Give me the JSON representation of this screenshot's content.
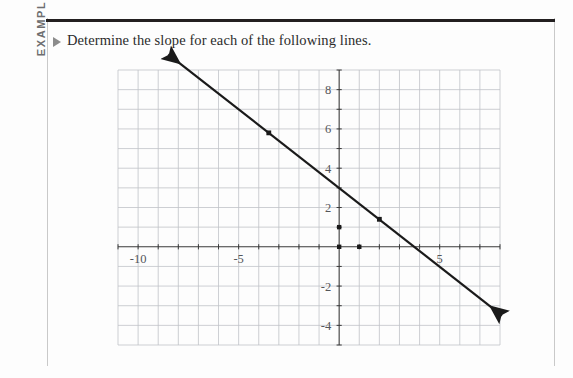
{
  "page": {
    "label_vertical": "EXAMPLE",
    "heading": "Determine the slope for each of the following lines.",
    "bullet": "triangle-bullet",
    "colors": {
      "rule": "#231f20",
      "frame": "#c9c9c9",
      "label": "#6d6e70",
      "text": "#2b2b2b",
      "grid_minor": "#c0c3c8",
      "grid_major": "#8a8d92",
      "axis": "#3a3a3a",
      "line": "#1a1a1a",
      "tick_text": "#54565a"
    }
  },
  "chart_data": {
    "type": "line",
    "title": "",
    "xlabel": "",
    "ylabel": "",
    "xlim": [
      -11,
      8
    ],
    "ylim": [
      -5,
      9
    ],
    "grid": true,
    "grid_step": 1,
    "legend": "none",
    "x_ticks": [
      -10,
      -5,
      5
    ],
    "x_tick_labels": [
      "-10",
      "-5",
      "5"
    ],
    "y_ticks": [
      8,
      6,
      4,
      2,
      -2,
      -4
    ],
    "y_tick_labels": [
      "8",
      "6",
      "4",
      "2",
      "-2",
      "-4"
    ],
    "series": [
      {
        "name": "line-1",
        "slope": -0.8,
        "y_intercept": 3,
        "x_intercept": 3.75,
        "endpoints": [
          [
            -8.5,
            9.8
          ],
          [
            8.1,
            -3.5
          ]
        ],
        "arrowheads": [
          "start",
          "end"
        ],
        "points": [
          [
            -3.5,
            5.8
          ],
          [
            2,
            1.4
          ]
        ]
      }
    ],
    "marker_points": [
      [
        0,
        1
      ],
      [
        0,
        0
      ],
      [
        1,
        0
      ]
    ],
    "annotations": []
  }
}
